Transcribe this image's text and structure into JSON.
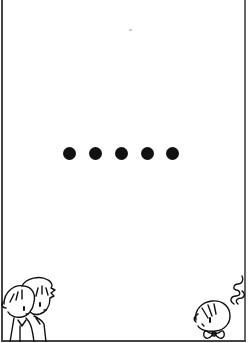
{
  "panel": {
    "type": "comic-panel",
    "background": "#ffffff",
    "border_color": "#444444",
    "ellipsis": {
      "count": 5,
      "color": "#111111",
      "dots": [
        {
          "cx": 69,
          "cy": 153
        },
        {
          "cx": 95,
          "cy": 153
        },
        {
          "cx": 121,
          "cy": 153
        },
        {
          "cx": 147,
          "cy": 153
        },
        {
          "cx": 172,
          "cy": 153
        }
      ]
    },
    "characters": [
      {
        "name": "two-chibi-characters",
        "position": "bottom-left"
      },
      {
        "name": "chibi-character-with-smoke",
        "position": "bottom-right"
      }
    ]
  }
}
